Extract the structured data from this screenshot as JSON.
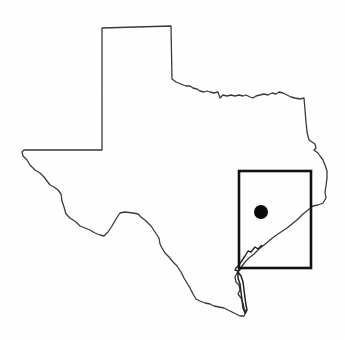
{
  "map": {
    "region": "Texas",
    "style": "outline",
    "colors": {
      "background": "#fefefe",
      "outline": "#3a3a3a",
      "inset_box": "#111111",
      "marker": "#0a0a0a"
    },
    "inset_box": {
      "x": 239,
      "y": 171,
      "width": 72,
      "height": 97
    },
    "marker": {
      "cx": 261,
      "cy": 212,
      "r": 7,
      "shape": "filled-circle"
    }
  }
}
